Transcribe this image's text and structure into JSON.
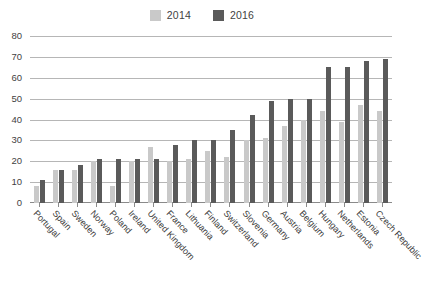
{
  "chart_data": {
    "type": "bar",
    "title": "",
    "subtitle": "",
    "xlabel": "",
    "ylabel": "",
    "ylim": [
      0,
      80
    ],
    "ytick_step": 10,
    "yticks": [
      80,
      70,
      60,
      50,
      40,
      30,
      20,
      10,
      0
    ],
    "grid": true,
    "legend_position": "top-center",
    "categories": [
      "Portugal",
      "Spain",
      "Sweden",
      "Norway",
      "Poland",
      "Ireland",
      "United Kingdom",
      "France",
      "Lithuania",
      "Finland",
      "Switzerland",
      "Slovenia",
      "Germany",
      "Austria",
      "Belgium",
      "Hungary",
      "Netherlands",
      "Estonia",
      "Czech Republic"
    ],
    "series": [
      {
        "name": "2014",
        "color": "#c9c9c9",
        "values": [
          8,
          16,
          16,
          20,
          8,
          20,
          27,
          20,
          21,
          25,
          22,
          30,
          31,
          37,
          40,
          44,
          39,
          47,
          44
        ]
      },
      {
        "name": "2016",
        "color": "#5a5a5a",
        "values": [
          11,
          16,
          18,
          21,
          21,
          21,
          21,
          28,
          30,
          30,
          35,
          42,
          49,
          50,
          50,
          65,
          65,
          68,
          69
        ]
      }
    ]
  },
  "legend": {
    "entries": [
      {
        "label": "2014",
        "color": "#c9c9c9"
      },
      {
        "label": "2016",
        "color": "#5a5a5a"
      }
    ]
  },
  "axes": {
    "y": {
      "ticks": [
        "80",
        "70",
        "60",
        "50",
        "40",
        "30",
        "20",
        "10",
        "0"
      ]
    }
  },
  "style": {
    "gridline_color": "#b6b6b6",
    "axis_color": "#8a8a8a",
    "text_color": "#3a3a3a",
    "background": "#ffffff"
  }
}
